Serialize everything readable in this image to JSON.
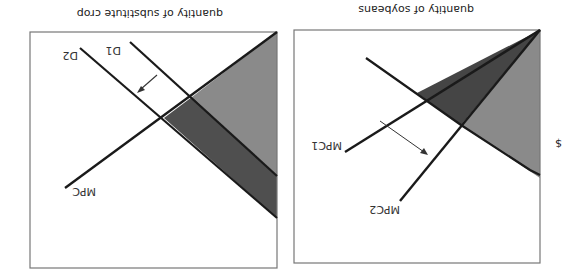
{
  "figure": {
    "orientation": "rotated-180",
    "colors": {
      "background": "#ffffff",
      "frame": "#777777",
      "line": "#1a1a1a",
      "light_region": "#8a8a8a",
      "dark_region": "#4a4a4a",
      "arrow": "#333333"
    }
  },
  "panels": [
    {
      "id": "substitute-crop",
      "x_axis_label": "quantity of substitute crop",
      "y_axis_label": "",
      "curves": {
        "supply": "MPC",
        "demand_initial": "D1",
        "demand_shifted": "D2"
      },
      "shift": "demand shifts from D1 to D2"
    },
    {
      "id": "soybeans",
      "x_axis_label": "quantity of soybeans",
      "y_axis_label": "$",
      "curves": {
        "supply_initial": "MPC1",
        "supply_shifted": "MPC2",
        "demand": ""
      },
      "shift": "supply shifts from MPC1 to MPC2"
    }
  ]
}
